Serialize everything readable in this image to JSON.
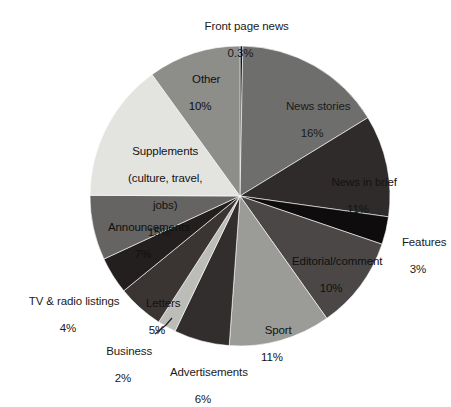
{
  "chart_data": {
    "type": "pie",
    "title": "",
    "subtitle": "",
    "xlabel": "",
    "ylabel": "",
    "legend_position": "none",
    "grid": false,
    "label_format": "name + percent",
    "start_angle_deg": 0,
    "direction": "clockwise",
    "categories": [
      "Front page news",
      "News stories",
      "News in brief",
      "Features",
      "Editorial/comment",
      "Sport",
      "Advertisements",
      "Business",
      "Letters",
      "TV & radio listings",
      "Announcements",
      "Supplements (culture, travel, jobs)",
      "Other"
    ],
    "values": [
      0.3,
      16,
      11,
      3,
      10,
      11,
      6,
      2,
      5,
      4,
      7,
      15,
      10
    ],
    "value_labels": [
      "0.3%",
      "16%",
      "11%",
      "3%",
      "10%",
      "11%",
      "6%",
      "2%",
      "5%",
      "4%",
      "7%",
      "15%",
      "10%"
    ],
    "colors": [
      "#111111",
      "#6e6e6c",
      "#2e2b2a",
      "#0e0c0c",
      "#4a4746",
      "#9b9b98",
      "#312e2d",
      "#bcbcb9",
      "#3a3433",
      "#221f1e",
      "#666462",
      "#e3e3e0",
      "#8d8d8a"
    ]
  },
  "slices": {
    "front_page_news": {
      "name": "Front page news",
      "pct": "0.3%"
    },
    "news_stories": {
      "name": "News stories",
      "pct": "16%"
    },
    "news_in_brief": {
      "name": "News in brief",
      "pct": "11%"
    },
    "features": {
      "name": "Features",
      "pct": "3%"
    },
    "editorial": {
      "name": "Editorial/comment",
      "pct": "10%"
    },
    "sport": {
      "name": "Sport",
      "pct": "11%"
    },
    "advertisements": {
      "name": "Advertisements",
      "pct": "6%"
    },
    "business": {
      "name": "Business",
      "pct": "2%"
    },
    "letters": {
      "name": "Letters",
      "pct": "5%"
    },
    "tv_radio": {
      "name": "TV & radio listings",
      "pct": "4%"
    },
    "announcements": {
      "name": "Announcements",
      "pct": "7%"
    },
    "supplements": {
      "name_line1": "Supplements",
      "name_line2": "(culture, travel,",
      "name_line3": "jobs)",
      "pct": "15%"
    },
    "other": {
      "name": "Other",
      "pct": "10%"
    }
  }
}
